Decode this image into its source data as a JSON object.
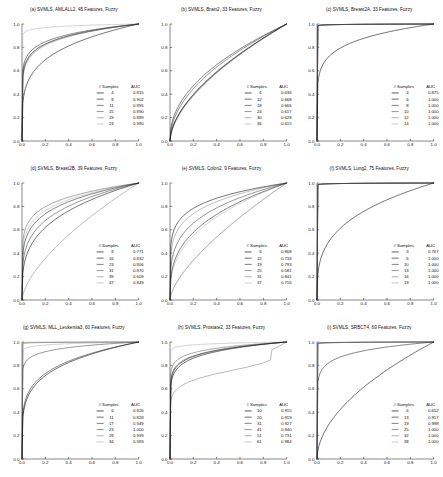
{
  "figure": {
    "layout": "3x3 grid of ROC curve panels",
    "legend_headers": {
      "samples": "# Samples",
      "auc": "AUC"
    },
    "axis": {
      "xticks": [
        "0.0",
        "0.2",
        "0.4",
        "0.6",
        "0.8",
        "1.0"
      ],
      "yticks": [
        "0.0",
        "0.2",
        "0.4",
        "0.6",
        "0.8",
        "1.0"
      ],
      "xlim": [
        0.0,
        1.0
      ],
      "ylim": [
        0.0,
        1.0
      ],
      "grid": false
    },
    "series_colors": [
      "#111111",
      "#2e2e2e",
      "#4a4a4a",
      "#6b6b6b",
      "#8e8e8e",
      "#b4b4b4"
    ]
  },
  "chart_data": [
    {
      "type": "line",
      "panel": "a",
      "title": "(a) SVMLS, AMLALL2, 45 Features, Fuzzy",
      "xlabel": "",
      "ylabel": "",
      "xlim": [
        0.0,
        1.0
      ],
      "ylim": [
        0.0,
        1.0
      ],
      "legend_position": "lower-right",
      "categories": [
        "4",
        "8",
        "11",
        "15",
        "19",
        "23"
      ],
      "series": [
        {
          "name": "4",
          "samples": 4,
          "auc": "0.815",
          "auc_value": 0.815
        },
        {
          "name": "8",
          "samples": 8,
          "auc": "0.902",
          "auc_value": 0.902
        },
        {
          "name": "11",
          "samples": 11,
          "auc": "0.895",
          "auc_value": 0.895
        },
        {
          "name": "15",
          "samples": 15,
          "auc": "0.890",
          "auc_value": 0.89
        },
        {
          "name": "19",
          "samples": 19,
          "auc": "0.889",
          "auc_value": 0.889
        },
        {
          "name": "23",
          "samples": 23,
          "auc": "0.980",
          "auc_value": 0.98
        }
      ]
    },
    {
      "type": "line",
      "panel": "b",
      "title": "(b) SVMLS, Brain2, 33 Features, Fuzzy",
      "xlabel": "",
      "ylabel": "",
      "xlim": [
        0.0,
        1.0
      ],
      "ylim": [
        0.0,
        1.0
      ],
      "legend_position": "lower-right",
      "categories": [
        "6",
        "12",
        "18",
        "24",
        "30",
        "36"
      ],
      "series": [
        {
          "name": "6",
          "samples": 6,
          "auc": "0.636",
          "auc_value": 0.636
        },
        {
          "name": "12",
          "samples": 12,
          "auc": "0.668",
          "auc_value": 0.668
        },
        {
          "name": "18",
          "samples": 18,
          "auc": "0.666",
          "auc_value": 0.666
        },
        {
          "name": "24",
          "samples": 24,
          "auc": "0.617",
          "auc_value": 0.617
        },
        {
          "name": "30",
          "samples": 30,
          "auc": "0.628",
          "auc_value": 0.628
        },
        {
          "name": "36",
          "samples": 36,
          "auc": "0.615",
          "auc_value": 0.615
        }
      ]
    },
    {
      "type": "line",
      "panel": "c",
      "title": "(c) SVMLS, Breast2A, 33 Features, Fuzzy",
      "xlabel": "",
      "ylabel": "",
      "xlim": [
        0.0,
        1.0
      ],
      "ylim": [
        0.0,
        1.0
      ],
      "legend_position": "lower-right",
      "categories": [
        "4",
        "6",
        "8",
        "10",
        "12",
        "14"
      ],
      "series": [
        {
          "name": "4",
          "samples": 4,
          "auc": "0.875",
          "auc_value": 0.875
        },
        {
          "name": "6",
          "samples": 6,
          "auc": "1.000",
          "auc_value": 1.0
        },
        {
          "name": "8",
          "samples": 8,
          "auc": "1.000",
          "auc_value": 1.0
        },
        {
          "name": "10",
          "samples": 10,
          "auc": "1.000",
          "auc_value": 1.0
        },
        {
          "name": "12",
          "samples": 12,
          "auc": "1.000",
          "auc_value": 1.0
        },
        {
          "name": "14",
          "samples": 14,
          "auc": "1.000",
          "auc_value": 1.0
        }
      ]
    },
    {
      "type": "line",
      "panel": "d",
      "title": "(d) SVMLS, Breast2B, 39 Features, Fuzzy",
      "xlabel": "",
      "ylabel": "",
      "xlim": [
        0.0,
        1.0
      ],
      "ylim": [
        0.0,
        1.0
      ],
      "legend_position": "lower-right",
      "categories": [
        "8",
        "16",
        "23",
        "31",
        "39",
        "47"
      ],
      "series": [
        {
          "name": "8",
          "samples": 8,
          "auc": "0.771",
          "auc_value": 0.771
        },
        {
          "name": "16",
          "samples": 16,
          "auc": "0.832",
          "auc_value": 0.832
        },
        {
          "name": "23",
          "samples": 23,
          "auc": "0.806",
          "auc_value": 0.806
        },
        {
          "name": "31",
          "samples": 31,
          "auc": "0.870",
          "auc_value": 0.87
        },
        {
          "name": "39",
          "samples": 39,
          "auc": "0.609",
          "auc_value": 0.609
        },
        {
          "name": "47",
          "samples": 47,
          "auc": "0.849",
          "auc_value": 0.849
        }
      ]
    },
    {
      "type": "line",
      "panel": "e",
      "title": "(e) SVMLS, Colon2, 9 Features, Fuzzy",
      "xlabel": "",
      "ylabel": "",
      "xlim": [
        0.0,
        1.0
      ],
      "ylim": [
        0.0,
        1.0
      ],
      "legend_position": "lower-right",
      "categories": [
        "6",
        "12",
        "19",
        "25",
        "31",
        "37"
      ],
      "series": [
        {
          "name": "6",
          "samples": 6,
          "auc": "0.868",
          "auc_value": 0.868
        },
        {
          "name": "12",
          "samples": 12,
          "auc": "0.734",
          "auc_value": 0.734
        },
        {
          "name": "19",
          "samples": 19,
          "auc": "0.793",
          "auc_value": 0.793
        },
        {
          "name": "25",
          "samples": 25,
          "auc": "0.581",
          "auc_value": 0.581
        },
        {
          "name": "31",
          "samples": 31,
          "auc": "0.841",
          "auc_value": 0.841
        },
        {
          "name": "37",
          "samples": 37,
          "auc": "0.716",
          "auc_value": 0.716
        }
      ]
    },
    {
      "type": "line",
      "panel": "f",
      "title": "(f) SVMLS, Lung2, 75 Features, Fuzzy",
      "xlabel": "",
      "ylabel": "",
      "xlim": [
        0.0,
        1.0
      ],
      "ylim": [
        0.0,
        1.0
      ],
      "legend_position": "lower-right",
      "categories": [
        "3",
        "6",
        "10",
        "13",
        "16",
        "19"
      ],
      "series": [
        {
          "name": "3",
          "samples": 3,
          "auc": "0.767",
          "auc_value": 0.767
        },
        {
          "name": "6",
          "samples": 6,
          "auc": "1.000",
          "auc_value": 1.0
        },
        {
          "name": "10",
          "samples": 10,
          "auc": "1.000",
          "auc_value": 1.0
        },
        {
          "name": "13",
          "samples": 13,
          "auc": "1.000",
          "auc_value": 1.0
        },
        {
          "name": "16",
          "samples": 16,
          "auc": "1.000",
          "auc_value": 1.0
        },
        {
          "name": "19",
          "samples": 19,
          "auc": "1.000",
          "auc_value": 1.0
        }
      ]
    },
    {
      "type": "line",
      "panel": "g",
      "title": "(g) SVMLS, MLL_Leukemia3, 60 Features, Fuzzy",
      "xlabel": "",
      "ylabel": "",
      "xlim": [
        0.0,
        1.0
      ],
      "ylim": [
        0.0,
        1.0
      ],
      "legend_position": "lower-right",
      "categories": [
        "6",
        "11",
        "17",
        "23",
        "28",
        "34"
      ],
      "series": [
        {
          "name": "6",
          "samples": 6,
          "auc": "0.826",
          "auc_value": 0.826
        },
        {
          "name": "11",
          "samples": 11,
          "auc": "0.828",
          "auc_value": 0.828
        },
        {
          "name": "17",
          "samples": 17,
          "auc": "0.949",
          "auc_value": 0.949
        },
        {
          "name": "23",
          "samples": 23,
          "auc": "1.000",
          "auc_value": 1.0
        },
        {
          "name": "28",
          "samples": 28,
          "auc": "0.999",
          "auc_value": 0.999
        },
        {
          "name": "34",
          "samples": 34,
          "auc": "0.983",
          "auc_value": 0.983
        }
      ]
    },
    {
      "type": "line",
      "panel": "h",
      "title": "(h) SVMLS, Prostate2, 33 Features, Fuzzy",
      "xlabel": "",
      "ylabel": "",
      "xlim": [
        0.0,
        1.0
      ],
      "ylim": [
        0.0,
        1.0
      ],
      "legend_position": "lower-right",
      "categories": [
        "10",
        "20",
        "31",
        "41",
        "51",
        "61"
      ],
      "series": [
        {
          "name": "10",
          "samples": 10,
          "auc": "0.915",
          "auc_value": 0.915
        },
        {
          "name": "20",
          "samples": 20,
          "auc": "0.919",
          "auc_value": 0.919
        },
        {
          "name": "31",
          "samples": 31,
          "auc": "0.927",
          "auc_value": 0.927
        },
        {
          "name": "41",
          "samples": 41,
          "auc": "0.940",
          "auc_value": 0.94
        },
        {
          "name": "51",
          "samples": 51,
          "auc": "0.731",
          "auc_value": 0.731
        },
        {
          "name": "61",
          "samples": 61,
          "auc": "0.984",
          "auc_value": 0.984
        }
      ]
    },
    {
      "type": "line",
      "panel": "i",
      "title": "(i) SVMLS, SRBCT4, 69 Features, Fuzzy",
      "xlabel": "",
      "ylabel": "",
      "xlim": [
        0.0,
        1.0
      ],
      "ylim": [
        0.0,
        1.0
      ],
      "legend_position": "lower-right",
      "categories": [
        "6",
        "13",
        "19",
        "25",
        "32",
        "38"
      ],
      "series": [
        {
          "name": "6",
          "samples": 6,
          "auc": "0.652",
          "auc_value": 0.652
        },
        {
          "name": "13",
          "samples": 13,
          "auc": "0.917",
          "auc_value": 0.917
        },
        {
          "name": "19",
          "samples": 19,
          "auc": "0.998",
          "auc_value": 0.998
        },
        {
          "name": "25",
          "samples": 25,
          "auc": "1.000",
          "auc_value": 1.0
        },
        {
          "name": "32",
          "samples": 32,
          "auc": "1.000",
          "auc_value": 1.0
        },
        {
          "name": "38",
          "samples": 38,
          "auc": "1.000",
          "auc_value": 1.0
        }
      ]
    }
  ]
}
